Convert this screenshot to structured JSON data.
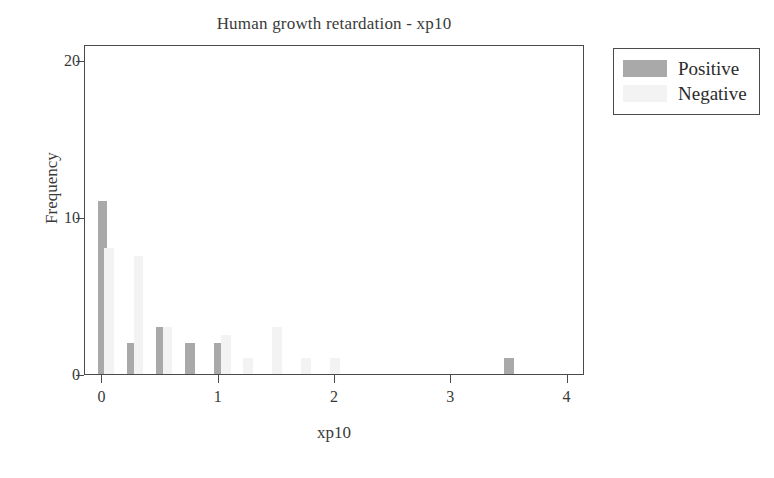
{
  "chart_data": {
    "type": "bar",
    "title": "Human growth retardation - xp10",
    "xlabel": "xp10",
    "ylabel": "Frequency",
    "xlim": [
      -0.15,
      4.15
    ],
    "ylim": [
      0,
      21
    ],
    "xticks": [
      "0",
      "1",
      "2",
      "3",
      "4"
    ],
    "xtick_values": [
      0,
      1,
      2,
      3,
      4
    ],
    "yticks": [
      "0",
      "10",
      "20"
    ],
    "ytick_values": [
      0,
      10,
      20
    ],
    "grid": false,
    "legend_position": "upper right outside",
    "bar_width": 0.085,
    "series": [
      {
        "name": "Positive",
        "color": "#a9a9a9",
        "x": [
          0.0,
          0.25,
          0.5,
          0.75,
          1.0,
          3.5
        ],
        "values": [
          11,
          2,
          3,
          2,
          2,
          1
        ]
      },
      {
        "name": "Negative",
        "color": "#f3f3f3",
        "x": [
          0.06,
          0.31,
          0.56,
          1.06,
          1.25,
          1.5,
          1.75,
          2.0
        ],
        "values": [
          8,
          7.5,
          3,
          2.5,
          1,
          3,
          1,
          1
        ]
      }
    ]
  },
  "legend": {
    "items": [
      {
        "label": "Positive",
        "color": "#a9a9a9"
      },
      {
        "label": "Negative",
        "color": "#f3f3f3"
      }
    ]
  }
}
